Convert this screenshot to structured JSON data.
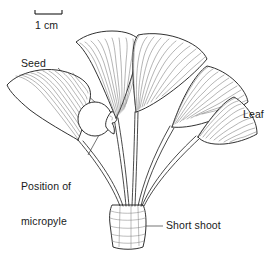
{
  "figure": {
    "background_color": "#ffffff",
    "ink_color": "#1a1a1a",
    "vein_color": "#555555"
  },
  "scale_bar": {
    "label": "1 cm",
    "length_px": 27,
    "x_start": 35,
    "x_end": 62,
    "y": 14
  },
  "labels": {
    "seed": "Seed",
    "micropyle_line1": "Position of",
    "micropyle_line2": "micropyle",
    "leaf": "Leaf",
    "short_shoot": "Short shoot"
  },
  "leaders": [
    {
      "name": "seed-leader",
      "x1": 58,
      "y1": 68,
      "x2": 96,
      "y2": 103
    },
    {
      "name": "micropyle-leader",
      "x1": 88,
      "y1": 155,
      "x2": 103,
      "y2": 127
    },
    {
      "name": "leaf-leader",
      "x1": 205,
      "y1": 115,
      "x2": 240,
      "y2": 115
    },
    {
      "name": "short-shoot-leader",
      "x1": 133,
      "y1": 226,
      "x2": 163,
      "y2": 226
    }
  ],
  "anatomy": {
    "leaf_count": 5,
    "seed_count": 1,
    "short_shoot": "cylindrical stem base with scale ridges"
  }
}
